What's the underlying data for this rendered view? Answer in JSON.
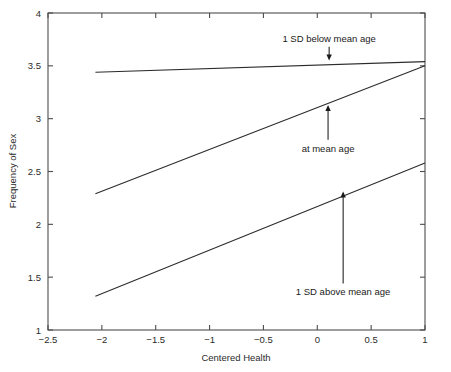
{
  "chart_data": {
    "type": "line",
    "title": "",
    "xlabel": "Centered Health",
    "ylabel": "Frequency of Sex",
    "xlim": [
      -2.5,
      1
    ],
    "ylim": [
      1,
      4
    ],
    "grid": false,
    "legend": "none (inline annotations with arrows)",
    "xticks": [
      -2.5,
      -2,
      -1.5,
      -1,
      -0.5,
      0,
      0.5,
      1
    ],
    "xticklabels": [
      "-2.5",
      "-2",
      "-1.5",
      "-1",
      "-0.5",
      "0",
      "0.5",
      "1"
    ],
    "yticks": [
      1,
      1.5,
      2,
      2.5,
      3,
      3.5,
      4
    ],
    "yticklabels": [
      "1",
      "1.5",
      "2",
      "2.5",
      "3",
      "3.5",
      "4"
    ],
    "x": [
      -2.06,
      1
    ],
    "series": [
      {
        "name": "1 SD below mean age",
        "values": [
          3.44,
          3.54
        ],
        "annotation": {
          "label": "1 SD below mean age",
          "label_x": 0.11,
          "label_y": 3.76,
          "arrow_from_x": 0.11,
          "arrow_from_y": 3.68,
          "arrow_to_x": 0.11,
          "arrow_to_y": 3.55,
          "arrow_direction": "down"
        }
      },
      {
        "name": "at mean age",
        "values": [
          2.29,
          3.5
        ],
        "annotation": {
          "label": "at mean age",
          "label_x": 0.1,
          "label_y": 2.72,
          "arrow_from_x": 0.1,
          "arrow_from_y": 2.8,
          "arrow_to_x": 0.1,
          "arrow_to_y": 3.13,
          "arrow_direction": "up"
        }
      },
      {
        "name": "1 SD above mean age",
        "values": [
          1.32,
          2.58
        ],
        "annotation": {
          "label": "1 SD above mean age",
          "label_x": 0.24,
          "label_y": 1.36,
          "arrow_from_x": 0.24,
          "arrow_from_y": 1.44,
          "arrow_to_x": 0.24,
          "arrow_to_y": 2.31,
          "arrow_direction": "up"
        }
      }
    ]
  },
  "axes": {
    "x_title": "Centered Health",
    "y_title": "Frequency of Sex"
  },
  "ticks": {
    "x": [
      "-2.5",
      "-2",
      "-1.5",
      "-1",
      "-0.5",
      "0",
      "0.5",
      "1"
    ],
    "y": [
      "1",
      "1.5",
      "2",
      "2.5",
      "3",
      "3.5",
      "4"
    ]
  },
  "annotations": {
    "below": "1 SD below mean age",
    "mean": "at mean age",
    "above": "1 SD above mean age"
  }
}
